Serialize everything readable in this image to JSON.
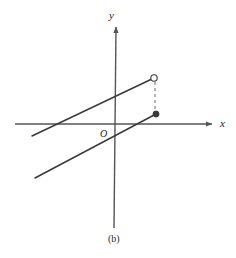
{
  "figure": {
    "caption": "(b)",
    "background_color": "#ffffff",
    "stroke_color": "#3a3a3a",
    "axis_color": "#555555",
    "width": 236,
    "height": 258
  },
  "axes": {
    "x_label": "x",
    "y_label": "y",
    "origin_label": "O",
    "x_axis": {
      "x1": 15,
      "y1": 124,
      "x2": 214,
      "y2": 124,
      "arrow": "right"
    },
    "y_axis": {
      "x1": 114,
      "y1": 228,
      "x2": 114,
      "y2": 27,
      "arrow": "up"
    }
  },
  "chart_data": {
    "type": "line",
    "title": "(b)",
    "xlabel": "x",
    "ylabel": "y",
    "grid": false,
    "legend": null,
    "annotations": [
      {
        "name": "origin",
        "label": "O",
        "px": [
          105,
          136
        ]
      }
    ],
    "series": [
      {
        "name": "upper-line",
        "style": "solid",
        "endpoint_style": "open-circle-right",
        "points_px": [
          [
            32,
            136
          ],
          [
            154,
            78
          ]
        ]
      },
      {
        "name": "lower-line",
        "style": "solid",
        "endpoint_style": "filled-dot-right",
        "points_px": [
          [
            35,
            178
          ],
          [
            156,
            114
          ]
        ]
      },
      {
        "name": "connector",
        "style": "dashed",
        "endpoint_style": "none",
        "points_px": [
          [
            155,
            82
          ],
          [
            155,
            111
          ]
        ]
      }
    ],
    "markers": [
      {
        "name": "open-circle-endpoint",
        "type": "open",
        "px": [
          154,
          78
        ],
        "radius": 3.2
      },
      {
        "name": "filled-dot-endpoint",
        "type": "filled",
        "px": [
          156,
          114
        ],
        "radius": 3.0
      }
    ]
  }
}
